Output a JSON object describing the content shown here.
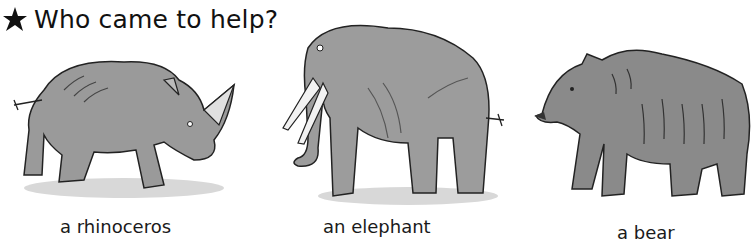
{
  "heading": {
    "icon": "star-icon",
    "title": "Who came to help?"
  },
  "animals": [
    {
      "name": "rhinoceros",
      "caption": "a rhinoceros"
    },
    {
      "name": "elephant",
      "caption": "an elephant"
    },
    {
      "name": "bear",
      "caption": "a bear"
    }
  ],
  "colors": {
    "ink": "#111111",
    "wash": "#8c8c8c",
    "shadow": "#d4d4d4"
  }
}
